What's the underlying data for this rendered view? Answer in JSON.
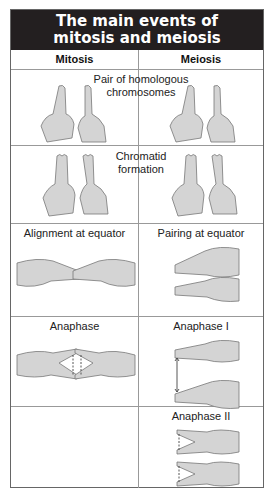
{
  "title": {
    "line1": "The main events of",
    "line2": "mitosis and meiosis"
  },
  "columns": {
    "mitosis": "Mitosis",
    "meiosis": "Meiosis"
  },
  "rows": [
    {
      "caption_line1": "Pair of homologous",
      "caption_line2": "chromosomes",
      "shared": true
    },
    {
      "caption_line1": "Chromatid",
      "caption_line2": "formation",
      "shared": true
    },
    {
      "mitosis": "Alignment at equator",
      "meiosis": "Pairing at equator"
    },
    {
      "mitosis": "Anaphase",
      "meiosis": "Anaphase I"
    },
    {
      "mitosis": "",
      "meiosis": "Anaphase II"
    }
  ],
  "colors": {
    "header_bg": "#231f20",
    "header_text": "#ffffff",
    "skin": "#d4d4d4",
    "grid": "#999999"
  }
}
